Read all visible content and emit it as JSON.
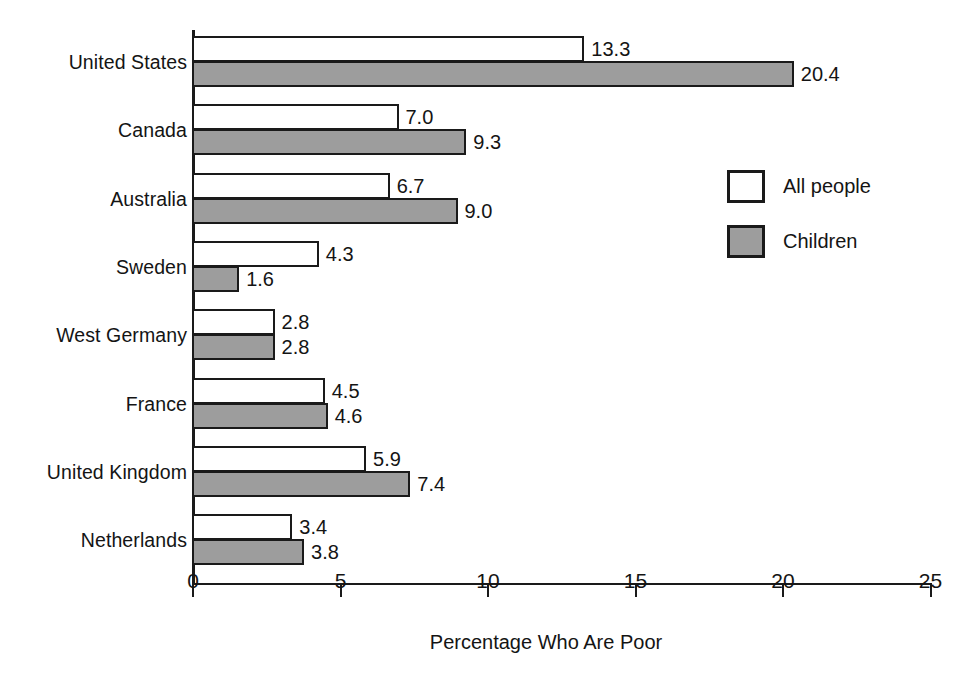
{
  "chart_data": {
    "type": "bar",
    "orientation": "horizontal",
    "title": "",
    "xlabel": "Percentage Who Are Poor",
    "ylabel": "",
    "xlim": [
      0,
      25
    ],
    "xticks": [
      0,
      5,
      10,
      15,
      20,
      25
    ],
    "xtick_labels": [
      "0",
      "5",
      "10",
      "15",
      "20",
      "25"
    ],
    "grid": false,
    "legend_position": "right",
    "categories": [
      "United States",
      "Canada",
      "Australia",
      "Sweden",
      "West Germany",
      "France",
      "United Kingdom",
      "Netherlands"
    ],
    "series": [
      {
        "name": "All people",
        "color": "#ffffff",
        "values": [
          13.3,
          7.0,
          6.7,
          4.3,
          2.8,
          4.5,
          5.9,
          3.4
        ],
        "labels": [
          "13.3",
          "7.0",
          "6.7",
          "4.3",
          "2.8",
          "4.5",
          "5.9",
          "3.4"
        ]
      },
      {
        "name": "Children",
        "color": "#9d9d9d",
        "values": [
          20.4,
          9.3,
          9.0,
          1.6,
          2.8,
          4.6,
          7.4,
          3.8
        ],
        "labels": [
          "20.4",
          "9.3",
          "9.0",
          "1.6",
          "2.8",
          "4.6",
          "7.4",
          "3.8"
        ]
      }
    ]
  },
  "legend": {
    "entries": [
      {
        "label": "All people",
        "swatch": "all"
      },
      {
        "label": "Children",
        "swatch": "child"
      }
    ]
  },
  "colors": {
    "axis": "#1a1a1a",
    "all_people_fill": "#ffffff",
    "children_fill": "#9d9d9d",
    "text": "#141414",
    "background": "#ffffff"
  }
}
